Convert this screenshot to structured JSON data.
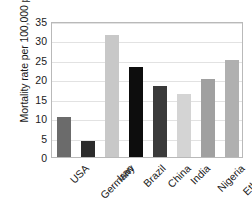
{
  "chart_data": {
    "type": "bar",
    "title": "",
    "xlabel": "",
    "ylabel": "Mortality rate per 100,000 people",
    "categories": [
      "USA",
      "Germany",
      "Iran",
      "Brazil",
      "China",
      "India",
      "Nigeria",
      "Ethiopia"
    ],
    "values": [
      10.4,
      4.1,
      31.5,
      23.2,
      18.3,
      16.2,
      20.1,
      25.0
    ],
    "bar_colors": [
      "#6b6b6b",
      "#2b2b2b",
      "#c8c8c8",
      "#0d0d0d",
      "#3a3a3a",
      "#d4d4d4",
      "#a0a0a0",
      "#b0b0b0"
    ],
    "ylim": [
      0,
      35
    ],
    "yticks": [
      0,
      5,
      10,
      15,
      20,
      25,
      30,
      35
    ],
    "ytick_labels": [
      "0",
      "5",
      "10",
      "15",
      "20",
      "25",
      "30",
      "35"
    ],
    "grid": true,
    "grid_axis": "y",
    "legend": false,
    "legend_position": "none",
    "xtick_rotation": -45,
    "frame_color": "#b9b9b9",
    "gridline_color": "#e2e2e2",
    "background": "#ffffff"
  }
}
